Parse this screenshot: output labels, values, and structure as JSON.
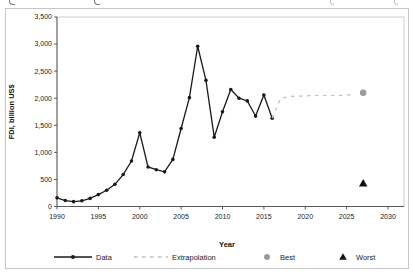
{
  "figure": {
    "y_axis": {
      "title": "FDI, billion US$",
      "ticks": [
        0,
        500,
        1000,
        1500,
        2000,
        2500,
        3000,
        3500
      ]
    },
    "x_axis": {
      "title": "Year",
      "ticks": [
        1990,
        1995,
        2000,
        2005,
        2010,
        2015,
        2020,
        2025,
        2030
      ]
    },
    "legend": [
      {
        "label": "Data",
        "marker": "line-dot",
        "color": "#1a1a1a"
      },
      {
        "label": "Extrapolation",
        "marker": "dashed-line",
        "color": "#bcbcbc"
      },
      {
        "label": "Best",
        "marker": "circle",
        "color": "#9a9a9a"
      },
      {
        "label": "Worst",
        "marker": "triangle",
        "color": "#111111"
      }
    ],
    "cropped_caption_marks": [
      {
        "x": 9
      },
      {
        "x": 94
      },
      {
        "x": 330
      },
      {
        "x": 394
      }
    ]
  },
  "chart_data": {
    "type": "line",
    "title": "",
    "xlabel": "Year",
    "ylabel": "FDI, billion US$",
    "xlim": [
      1990,
      2030
    ],
    "ylim": [
      0,
      3500
    ],
    "grid": false,
    "legend_position": "bottom",
    "series": [
      {
        "name": "Data",
        "style": "solid-line-with-dots",
        "color": "#1a1a1a",
        "x": [
          1990,
          1991,
          1992,
          1993,
          1994,
          1995,
          1996,
          1997,
          1998,
          1999,
          2000,
          2001,
          2002,
          2003,
          2004,
          2005,
          2006,
          2007,
          2008,
          2009,
          2010,
          2011,
          2012,
          2013,
          2014,
          2015,
          2016
        ],
        "y": [
          160,
          110,
          90,
          105,
          150,
          220,
          300,
          410,
          590,
          840,
          1360,
          730,
          680,
          640,
          870,
          1440,
          2010,
          2960,
          2330,
          1280,
          1750,
          2160,
          2000,
          1950,
          1670,
          2060,
          1630
        ]
      },
      {
        "name": "Extrapolation",
        "style": "dashed-line",
        "color": "#bcbcbc",
        "x": [
          2016,
          2017,
          2018,
          2019,
          2020,
          2021,
          2022,
          2023,
          2024,
          2025,
          2026
        ],
        "y": [
          1630,
          1990,
          2030,
          2040,
          2040,
          2050,
          2050,
          2050,
          2050,
          2060,
          2060
        ]
      },
      {
        "name": "Best",
        "style": "point-circle",
        "color": "#9a9a9a",
        "x": [
          2027
        ],
        "y": [
          2100
        ]
      },
      {
        "name": "Worst",
        "style": "point-triangle",
        "color": "#111111",
        "x": [
          2027
        ],
        "y": [
          430
        ]
      }
    ]
  }
}
